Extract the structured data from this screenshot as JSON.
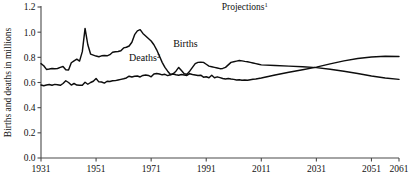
{
  "chart_data": {
    "type": "line",
    "title": "",
    "annotation": "Projections",
    "annotation_superscript": "1",
    "xlabel": "",
    "ylabel": "Births and deaths in millions",
    "xlim": [
      1931,
      2061
    ],
    "ylim": [
      0.0,
      1.2
    ],
    "grid": false,
    "legend": "inline-series-labels",
    "xticks": [
      1931,
      1951,
      1971,
      1991,
      2011,
      2031,
      2051,
      2061
    ],
    "xtick_labels": [
      "1931",
      "1951",
      "1971",
      "1991",
      "2011",
      "2031",
      "2051",
      "2061"
    ],
    "yticks": [
      0.0,
      0.2,
      0.4,
      0.6,
      0.8,
      1.0,
      1.2
    ],
    "ytick_labels": [
      "0.0",
      "0.2",
      "0.4",
      "0.6",
      "0.8",
      "1.0",
      "1.2"
    ],
    "projection_start_year": 2011,
    "crossover": {
      "year": 2031,
      "value": 0.72
    },
    "series": [
      {
        "name": "Births",
        "label": "Births",
        "label_superscript": "",
        "color": "#0d0d0d",
        "x": [
          1931,
          1932,
          1933,
          1934,
          1935,
          1936,
          1937,
          1938,
          1939,
          1940,
          1941,
          1942,
          1943,
          1944,
          1945,
          1946,
          1947,
          1948,
          1949,
          1950,
          1951,
          1952,
          1953,
          1954,
          1955,
          1956,
          1957,
          1958,
          1959,
          1960,
          1961,
          1962,
          1963,
          1964,
          1965,
          1966,
          1967,
          1968,
          1969,
          1970,
          1971,
          1972,
          1973,
          1974,
          1975,
          1976,
          1977,
          1978,
          1979,
          1980,
          1981,
          1982,
          1983,
          1984,
          1985,
          1986,
          1987,
          1988,
          1989,
          1990,
          1991,
          1992,
          1993,
          1994,
          1995,
          1996,
          1997,
          1998,
          1999,
          2000,
          2001,
          2002,
          2003,
          2004,
          2005,
          2006,
          2007,
          2008,
          2009,
          2010,
          2011,
          2016,
          2021,
          2026,
          2031,
          2036,
          2041,
          2046,
          2051,
          2056,
          2061
        ],
        "y": [
          0.75,
          0.733,
          0.704,
          0.707,
          0.711,
          0.709,
          0.711,
          0.72,
          0.727,
          0.702,
          0.7,
          0.757,
          0.772,
          0.785,
          0.77,
          0.845,
          1.03,
          0.9,
          0.826,
          0.818,
          0.81,
          0.805,
          0.812,
          0.815,
          0.812,
          0.821,
          0.84,
          0.845,
          0.847,
          0.852,
          0.875,
          0.88,
          0.89,
          0.92,
          0.98,
          1.01,
          1.02,
          0.99,
          0.97,
          0.95,
          0.93,
          0.9,
          0.86,
          0.81,
          0.76,
          0.72,
          0.69,
          0.663,
          0.67,
          0.69,
          0.72,
          0.695,
          0.67,
          0.666,
          0.69,
          0.72,
          0.75,
          0.76,
          0.762,
          0.76,
          0.745,
          0.73,
          0.725,
          0.72,
          0.715,
          0.71,
          0.712,
          0.72,
          0.74,
          0.76,
          0.765,
          0.77,
          0.775,
          0.772,
          0.768,
          0.765,
          0.76,
          0.755,
          0.75,
          0.745,
          0.74,
          0.735,
          0.73,
          0.725,
          0.718,
          0.706,
          0.69,
          0.672,
          0.652,
          0.636,
          0.625
        ]
      },
      {
        "name": "Deaths",
        "label": "Deaths",
        "label_superscript": "2",
        "color": "#0d0d0d",
        "x": [
          1931,
          1932,
          1933,
          1934,
          1935,
          1936,
          1937,
          1938,
          1939,
          1940,
          1941,
          1942,
          1943,
          1944,
          1945,
          1946,
          1947,
          1948,
          1949,
          1950,
          1951,
          1952,
          1953,
          1954,
          1955,
          1956,
          1957,
          1958,
          1959,
          1960,
          1961,
          1962,
          1963,
          1964,
          1965,
          1966,
          1967,
          1968,
          1969,
          1970,
          1971,
          1972,
          1973,
          1974,
          1975,
          1976,
          1977,
          1978,
          1979,
          1980,
          1981,
          1982,
          1983,
          1984,
          1985,
          1986,
          1987,
          1988,
          1989,
          1990,
          1991,
          1992,
          1993,
          1994,
          1995,
          1996,
          1997,
          1998,
          1999,
          2000,
          2001,
          2002,
          2003,
          2004,
          2005,
          2006,
          2007,
          2008,
          2009,
          2010,
          2011,
          2016,
          2021,
          2026,
          2031,
          2036,
          2041,
          2046,
          2051,
          2056,
          2061
        ],
        "y": [
          0.58,
          0.574,
          0.58,
          0.584,
          0.578,
          0.585,
          0.582,
          0.578,
          0.592,
          0.614,
          0.6,
          0.58,
          0.592,
          0.58,
          0.578,
          0.578,
          0.602,
          0.586,
          0.6,
          0.61,
          0.632,
          0.605,
          0.604,
          0.595,
          0.61,
          0.608,
          0.614,
          0.615,
          0.62,
          0.625,
          0.63,
          0.636,
          0.65,
          0.644,
          0.65,
          0.652,
          0.644,
          0.656,
          0.66,
          0.656,
          0.645,
          0.668,
          0.672,
          0.668,
          0.661,
          0.665,
          0.655,
          0.662,
          0.668,
          0.662,
          0.658,
          0.664,
          0.66,
          0.656,
          0.67,
          0.664,
          0.66,
          0.655,
          0.658,
          0.642,
          0.646,
          0.638,
          0.658,
          0.638,
          0.645,
          0.639,
          0.632,
          0.628,
          0.632,
          0.628,
          0.625,
          0.62,
          0.622,
          0.618,
          0.62,
          0.618,
          0.622,
          0.626,
          0.628,
          0.632,
          0.636,
          0.66,
          0.682,
          0.702,
          0.722,
          0.748,
          0.772,
          0.79,
          0.802,
          0.808,
          0.806
        ]
      }
    ],
    "series_label_positions": [
      {
        "name": "Births",
        "year": 1979,
        "value": 0.885
      },
      {
        "name": "Deaths",
        "year": 1963,
        "value": 0.772
      }
    ],
    "annotation_position": {
      "year": 2005,
      "value": 1.175
    }
  }
}
